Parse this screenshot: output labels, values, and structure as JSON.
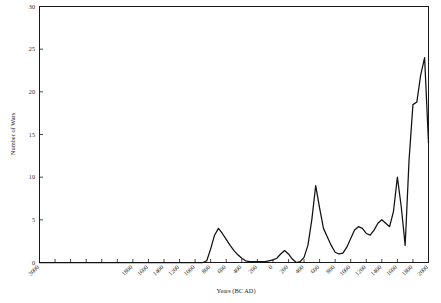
{
  "chart_data": {
    "type": "line",
    "title": "",
    "xlabel": "Years (BC AD)",
    "ylabel": "Number of Wars",
    "xlim": [
      -3000,
      2000
    ],
    "ylim": [
      0,
      30
    ],
    "grid": false,
    "legend": "none",
    "x_ticks": [
      -3000,
      -2800,
      -2600,
      -2400,
      -2200,
      -2000,
      -1800,
      -1600,
      -1400,
      -1200,
      -1000,
      -800,
      -600,
      -400,
      -200,
      0,
      200,
      400,
      600,
      800,
      1000,
      1200,
      1400,
      1600,
      1800,
      2000
    ],
    "x_tick_labels": [
      "3000",
      "2800",
      "2600",
      "2400",
      "2200",
      "2000",
      "1800",
      "1600",
      "1400",
      "1200",
      "1000",
      "800",
      "600",
      "400",
      "200",
      "0",
      "200",
      "400",
      "600",
      "800",
      "1000",
      "1200",
      "1400",
      "1600",
      "1800",
      "2000"
    ],
    "x_tick_labels_shown": [
      "3000",
      "1800",
      "1600",
      "1400",
      "1200",
      "1000",
      "800",
      "600",
      "400",
      "200",
      "0",
      "200",
      "400",
      "600",
      "800",
      "1000",
      "1200",
      "1400",
      "1600",
      "1800",
      "2000"
    ],
    "y_ticks": [
      0,
      5,
      10,
      15,
      20,
      25,
      30
    ],
    "y_tick_labels": [
      "0",
      "5",
      "10",
      "15",
      "20",
      "25",
      "30"
    ],
    "line_color": "#111111",
    "series": [
      {
        "name": "Number of Wars",
        "x": [
          -3000,
          -2800,
          -2600,
          -2400,
          -2200,
          -2000,
          -1800,
          -1600,
          -1400,
          -1200,
          -1100,
          -1000,
          -950,
          -900,
          -850,
          -800,
          -750,
          -700,
          -650,
          -600,
          -550,
          -500,
          -450,
          -400,
          -350,
          -300,
          -250,
          -200,
          -150,
          -100,
          -50,
          0,
          50,
          100,
          150,
          200,
          250,
          300,
          350,
          400,
          450,
          500,
          550,
          600,
          650,
          700,
          750,
          800,
          850,
          900,
          950,
          1000,
          1050,
          1100,
          1150,
          1200,
          1250,
          1300,
          1350,
          1400,
          1450,
          1500,
          1550,
          1600,
          1650,
          1700,
          1750,
          1800,
          1850,
          1900,
          1950,
          2000
        ],
        "values": [
          0,
          0,
          0,
          0,
          0,
          0,
          0,
          0,
          0,
          0,
          0,
          0,
          0,
          0,
          0.2,
          1.6,
          3.2,
          4.0,
          3.4,
          2.7,
          2.0,
          1.4,
          0.9,
          0.5,
          0.2,
          0.1,
          0.1,
          0.1,
          0.1,
          0.1,
          0.2,
          0.3,
          0.5,
          1.0,
          1.4,
          1.0,
          0.4,
          0.0,
          0.1,
          0.6,
          2.0,
          5.0,
          9.0,
          6.4,
          4.0,
          3.0,
          2.0,
          1.2,
          1.0,
          1.1,
          1.8,
          2.8,
          3.8,
          4.2,
          4.0,
          3.4,
          3.2,
          3.8,
          4.6,
          5.0,
          4.6,
          4.2,
          6.0,
          10.0,
          6.5,
          2.0,
          12.0,
          18.5,
          18.8,
          22.0,
          24.0,
          14.0
        ]
      }
    ]
  },
  "axis_titles": {
    "x": "Years (BC AD)",
    "y": "Number of Wars"
  }
}
